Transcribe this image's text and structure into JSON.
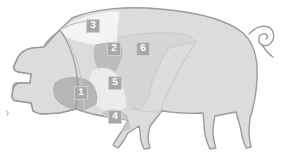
{
  "diagram": {
    "orientation": "facing-left",
    "colors": {
      "background": "#ffffff",
      "outline": "#9b9b9b",
      "body_fill": "#dcdcdc",
      "head_fill": "#d3d3d3",
      "leg_fill": "#d8d8d8",
      "badge_fill": "#a8a8a8",
      "badge_border": "#cfcfcf",
      "badge_text": "#ffffff",
      "region_divider": "#bdbdbd"
    },
    "regions": [
      {
        "number": "1",
        "name": "region-1-jowl",
        "fill": "#b6b6b6",
        "badge_x": 74,
        "badge_y": 86
      },
      {
        "number": "2",
        "name": "region-2-shoulder",
        "fill": "#c0c0c0",
        "badge_x": 107,
        "badge_y": 42
      },
      {
        "number": "3",
        "name": "region-3-neck-top",
        "fill": "#f4f4f4",
        "badge_x": 86,
        "badge_y": 19
      },
      {
        "number": "4",
        "name": "region-4-foreleg",
        "fill": "#c9c9c9",
        "badge_x": 108,
        "badge_y": 110
      },
      {
        "number": "5",
        "name": "region-5-picnic",
        "fill": "#ececec",
        "badge_x": 108,
        "badge_y": 76
      },
      {
        "number": "6",
        "name": "region-6-loin",
        "fill": "#d6d6d6",
        "badge_x": 136,
        "badge_y": 42
      }
    ],
    "features": [
      {
        "name": "tail",
        "label": "curled tail"
      },
      {
        "name": "snout",
        "label": "snout"
      },
      {
        "name": "ear",
        "label": "ear"
      }
    ]
  }
}
